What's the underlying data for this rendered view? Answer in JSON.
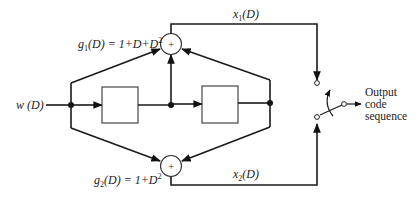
{
  "diagram": {
    "type": "convolutional-encoder",
    "input_label": "w (D)",
    "top_generator": {
      "label_prefix": "g",
      "label_sub": "1",
      "label_rest": "(D) = 1+D+D",
      "label_sup": "2",
      "adder_symbol": "+"
    },
    "bottom_generator": {
      "label_prefix": "g",
      "label_sub": "2",
      "label_rest": "(D) = 1+D",
      "label_sup": "2",
      "adder_symbol": "+"
    },
    "delay_elements": 2,
    "outputs": {
      "top": {
        "prefix": "x",
        "sub": "1",
        "rest": "(D)"
      },
      "bottom": {
        "prefix": "x",
        "sub": "2",
        "rest": "(D)"
      }
    },
    "output_text": [
      "Output",
      "code",
      "sequence"
    ]
  }
}
